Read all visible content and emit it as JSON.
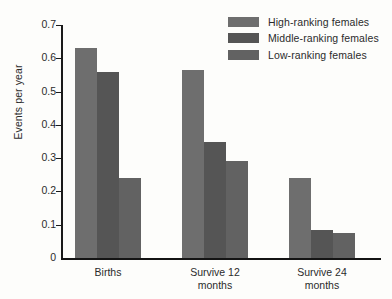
{
  "chart_data": {
    "type": "bar",
    "title": "",
    "xlabel": "",
    "ylabel": "Events per year",
    "ylim": [
      0,
      0.7
    ],
    "yticks": [
      0,
      0.1,
      0.2,
      0.3,
      0.4,
      0.5,
      0.6,
      0.7
    ],
    "ytick_labels": [
      "0",
      "0.1",
      "0.2",
      "0.3",
      "0.4",
      "0.5",
      "0.6",
      "0.7"
    ],
    "grid": false,
    "legend_position": "top-right",
    "categories": [
      "Births",
      "Survive 12 months",
      "Survive 24 months"
    ],
    "category_lines": [
      [
        "Births"
      ],
      [
        "Survive 12",
        "months"
      ],
      [
        "Survive 24",
        "months"
      ]
    ],
    "series": [
      {
        "name": "High-ranking females",
        "color": "#6e6e6e",
        "values": [
          0.63,
          0.565,
          0.24
        ]
      },
      {
        "name": "Middle-ranking females",
        "color": "#555555",
        "values": [
          0.56,
          0.35,
          0.083
        ]
      },
      {
        "name": "Low-ranking females",
        "color": "#626262",
        "values": [
          0.24,
          0.29,
          0.074
        ]
      }
    ]
  },
  "axis": {
    "line_color": "#1a1a1a",
    "text_color": "#2b2b2b"
  },
  "background": "#fdfdfb"
}
